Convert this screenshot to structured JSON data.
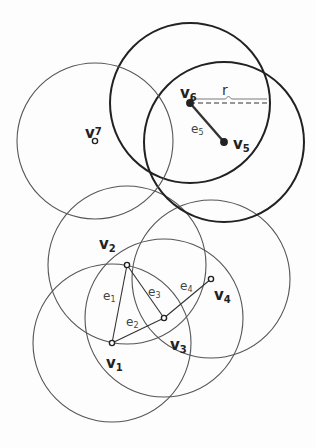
{
  "diagram": {
    "colors": {
      "thin_circle": "#555555",
      "bold_circle": "#222222",
      "edge": "#333333",
      "vertex": "#222222"
    },
    "vertices": [
      {
        "id": "v1",
        "label": "v",
        "sub": "1",
        "x": 112,
        "y": 343,
        "circle_r": 79,
        "bold": false,
        "lx": 106,
        "ly": 368
      },
      {
        "id": "v2",
        "label": "v",
        "sub": "2",
        "x": 127,
        "y": 265,
        "circle_r": 79,
        "bold": false,
        "lx": 99,
        "ly": 249
      },
      {
        "id": "v3",
        "label": "v",
        "sub": "3",
        "x": 164,
        "y": 318,
        "circle_r": 79,
        "bold": false,
        "lx": 170,
        "ly": 350
      },
      {
        "id": "v4",
        "label": "v",
        "sub": "4",
        "x": 211,
        "y": 279,
        "circle_r": 79,
        "bold": false,
        "lx": 214,
        "ly": 300
      },
      {
        "id": "v5",
        "label": "v",
        "sub": "5",
        "x": 224,
        "y": 142,
        "circle_r": 80,
        "bold": true,
        "lx": 233,
        "ly": 149
      },
      {
        "id": "v6",
        "label": "v",
        "sub": "6",
        "x": 190,
        "y": 103,
        "circle_r": 80,
        "bold": true,
        "lx": 180,
        "ly": 98
      },
      {
        "id": "v7",
        "label": "v",
        "sub": "7",
        "x": 95,
        "y": 141,
        "circle_r": 78,
        "bold": false,
        "lx": 85,
        "ly": 138
      }
    ],
    "edges": [
      {
        "id": "e1",
        "label": "e",
        "sub": "1",
        "from": "v1",
        "to": "v2",
        "lx": 103,
        "ly": 300,
        "bold": false
      },
      {
        "id": "e2",
        "label": "e",
        "sub": "2",
        "from": "v1",
        "to": "v3",
        "lx": 126,
        "ly": 326,
        "bold": false
      },
      {
        "id": "e3",
        "label": "e",
        "sub": "3",
        "from": "v2",
        "to": "v3",
        "lx": 148,
        "ly": 296,
        "bold": false
      },
      {
        "id": "e4",
        "label": "e",
        "sub": "4",
        "from": "v3",
        "to": "v4",
        "lx": 180,
        "ly": 290,
        "bold": false
      },
      {
        "id": "e5",
        "label": "e",
        "sub": "5",
        "from": "v6",
        "to": "v5",
        "lx": 191,
        "ly": 133,
        "bold": true
      }
    ],
    "radius_annotation": {
      "label": "r",
      "from_x": 190,
      "to_x": 267,
      "y": 103,
      "lx": 222,
      "ly": 95
    }
  }
}
